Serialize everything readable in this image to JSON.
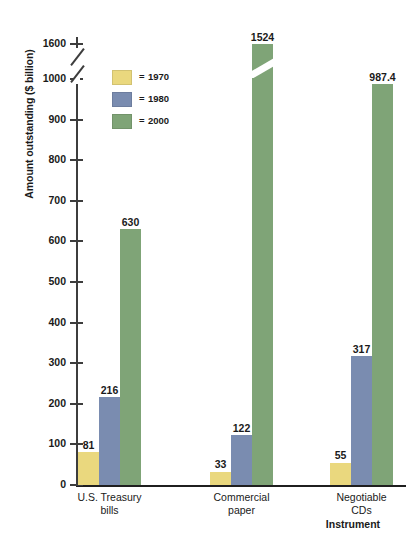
{
  "chart_data": {
    "type": "bar",
    "title": "",
    "xlabel": "Instrument",
    "ylabel": "Amount outstanding ($ billion)",
    "categories": [
      "U.S. Treasury bills",
      "Commercial paper",
      "Negotiable CDs"
    ],
    "category_lines": [
      [
        "U.S. Treasury",
        "bills"
      ],
      [
        "Commercial",
        "paper"
      ],
      [
        "Negotiable",
        "CDs"
      ]
    ],
    "series": [
      {
        "name": "1970",
        "color": "#ead87e",
        "values": [
          81,
          33,
          55
        ]
      },
      {
        "name": "1980",
        "color": "#7a8cb0",
        "values": [
          216,
          122,
          317
        ]
      },
      {
        "name": "2000",
        "color": "#7fa477",
        "values": [
          630,
          1524,
          987.4
        ]
      }
    ],
    "value_labels": [
      [
        "81",
        "216",
        "630"
      ],
      [
        "33",
        "122",
        "1524"
      ],
      [
        "55",
        "317",
        "987.4"
      ]
    ],
    "ytick_labels": [
      "0",
      "100",
      "200",
      "300",
      "400",
      "500",
      "600",
      "700",
      "800",
      "900",
      "1000",
      "1600"
    ],
    "ylim": [
      0,
      1600
    ],
    "axis_break": {
      "below": 1000,
      "above": 1600,
      "present": true
    },
    "broken_bars": [
      "1524"
    ],
    "grid": false,
    "legend_position": "upper-left-inside",
    "legend_prefix": "="
  }
}
